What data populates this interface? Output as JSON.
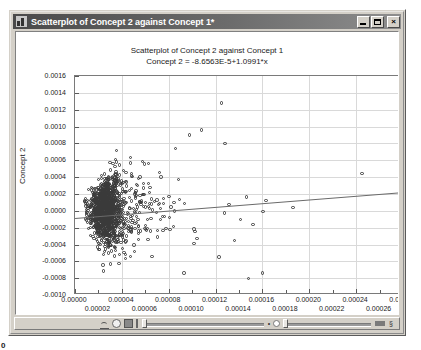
{
  "window": {
    "title": "Scatterplot of Concept 2 against Concept 1*",
    "icon": "chart-icon",
    "minimize_label": "_",
    "maximize_label": "",
    "close_label": "×"
  },
  "corner": {
    "mark": "0"
  },
  "toolbar": {
    "items": [
      {
        "name": "curve-icon",
        "label": ""
      },
      {
        "name": "circle-icon",
        "label": ""
      },
      {
        "name": "square-icon",
        "label": ""
      },
      {
        "name": "bar-icon",
        "label": ""
      }
    ],
    "glyph_left": "•",
    "glyph_right": "§"
  },
  "chart_data": {
    "type": "scatter",
    "title": "Scatterplot of Concept 2 against Concept 1",
    "subtitle": "Concept 2 = -8.6563E-5+1.0991*x",
    "xlabel": "Concept 1",
    "ylabel": "Concept 2",
    "xlim": [
      0.0,
      0.00028
    ],
    "ylim": [
      -0.001,
      0.0016
    ],
    "grid": true,
    "legend": "none",
    "regression": {
      "intercept": -8.6563e-05,
      "slope": 1.0991,
      "equation": "Concept 2 = -8.6563E-5+1.0991*x"
    },
    "xticks": [
      0.0,
      2e-05,
      4e-05,
      6e-05,
      8e-05,
      0.0001,
      0.00012,
      0.00014,
      0.00016,
      0.00018,
      0.0002,
      0.00022,
      0.00024,
      0.00026,
      0.00028
    ],
    "xticklabels": [
      "0.00000",
      "0.00002",
      "0.00004",
      "0.00006",
      "0.00008",
      "0.00010",
      "0.00012",
      "0.00014",
      "0.00016",
      "0.00018",
      "0.00020",
      "0.00022",
      "0.00024",
      "0.00026",
      "0.00028"
    ],
    "yticks": [
      0.0016,
      0.0014,
      0.0012,
      0.001,
      0.0008,
      0.0006,
      0.0004,
      0.0002,
      0.0,
      -0.0002,
      -0.0004,
      -0.0006,
      -0.0008,
      -0.001
    ],
    "yticklabels": [
      "0.0016",
      "0.0014",
      "0.0012",
      "0.0010",
      "0.0008",
      "0.0006",
      "0.0004",
      "0.0002",
      "0.0000",
      "-0.0002",
      "-0.0004",
      "-0.0006",
      "-0.0008",
      "-0.0010"
    ],
    "point_count": 1400,
    "marker": "open-circle",
    "cluster": {
      "x_center": 2.55e-05,
      "y_center": 0.0,
      "x_sigma": 1.15e-05,
      "y_sigma": 0.000115,
      "note": "dense cloud near origin with long right tail and sparse outliers"
    },
    "outliers": [
      {
        "x": 0.000245,
        "y": 0.00044
      },
      {
        "x": 0.000125,
        "y": 0.00128
      },
      {
        "x": 0.000108,
        "y": 0.00096
      },
      {
        "x": 9.8e-05,
        "y": 0.0009
      },
      {
        "x": 0.000128,
        "y": 0.0008
      },
      {
        "x": 8.6e-05,
        "y": 0.00074
      },
      {
        "x": 0.00016,
        "y": -0.00074
      },
      {
        "x": 0.000148,
        "y": -0.0008
      },
      {
        "x": 9.3e-05,
        "y": -0.00074
      },
      {
        "x": 0.000186,
        "y": 4e-05
      },
      {
        "x": 0.000163,
        "y": 0.00012
      },
      {
        "x": 0.000152,
        "y": -0.00016
      },
      {
        "x": 0.000141,
        "y": -0.0001
      }
    ]
  }
}
